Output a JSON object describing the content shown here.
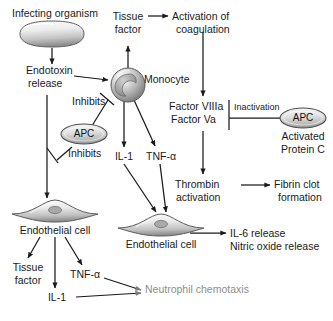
{
  "diagram": {
    "colors": {
      "line": "#1a1a1a",
      "cell_fill_light": "#f2f2f2",
      "cell_fill_mid": "#b8b8b8",
      "cell_fill_dark": "#7d7d7d",
      "nucleus": "#9a9a9a",
      "faded_text": "#8d8d8d",
      "background": "#ffffff"
    },
    "nodes": {
      "infecting_organism": "Infecting organism",
      "endotoxin_release_line1": "Endotoxin",
      "endotoxin_release_line2": "release",
      "inhibits_upper": "Inhibits",
      "inhibits_lower": "Inhibits",
      "apc_left": "APC",
      "apc_right": "APC",
      "activated_protein_c_line1": "Activated",
      "activated_protein_c_line2": "Protein C",
      "monocyte": "Monocyte",
      "tissue_factor_top_line1": "Tissue",
      "tissue_factor_top_line2": "factor",
      "activation_of_coagulation_line1": "Activation of",
      "activation_of_coagulation_line2": "coagulation",
      "factor_viiia": "Factor VIIIa",
      "factor_va": "Factor Va",
      "inactivation": "Inactivation",
      "il1_monocyte": "IL-1",
      "tnfa_monocyte": "TNF-α",
      "thrombin_activation_line1": "Thrombin",
      "thrombin_activation_line2": "activation",
      "fibrin_clot_line1": "Fibrin clot",
      "fibrin_clot_line2": "formation",
      "endothelial_cell_left": "Endothelial cell",
      "endothelial_cell_mid": "Endothelial cell",
      "il6_release": "IL-6 release",
      "nitric_oxide_release": "Nitric oxide release",
      "tissue_factor_bottom_line1": "Tissue",
      "tissue_factor_bottom_line2": "factor",
      "tnfa_endothelial": "TNF-α",
      "il1_endothelial": "IL-1",
      "neutrophil_chemotaxis": "Neutrophil chemotaxis"
    },
    "cells": {
      "bacillus_label": "infecting-organism-bacillus",
      "monocyte_label": "monocyte-cell",
      "endothelial_left_label": "endothelial-cell-left",
      "endothelial_mid_label": "endothelial-cell-middle"
    },
    "edges": [
      {
        "from": "infecting_organism",
        "to": "endotoxin_release",
        "type": "arrow"
      },
      {
        "from": "endotoxin_release",
        "to": "monocyte",
        "type": "arrow"
      },
      {
        "from": "endotoxin_release",
        "to": "endothelial_cell_left",
        "type": "arrow"
      },
      {
        "from": "apc_left",
        "to": "endotoxin_monocyte_link",
        "type": "inhibit"
      },
      {
        "from": "apc_left",
        "to": "endotoxin_endothelial_link",
        "type": "inhibit"
      },
      {
        "from": "monocyte",
        "to": "tissue_factor_top",
        "type": "arrow"
      },
      {
        "from": "tissue_factor_top",
        "to": "activation_of_coagulation",
        "type": "arrow"
      },
      {
        "from": "activation_of_coagulation",
        "to": "factor_viiia_va",
        "type": "arrow"
      },
      {
        "from": "apc_right",
        "to": "factor_viiia_va",
        "type": "inactivation-bar"
      },
      {
        "from": "factor_viiia_va",
        "to": "thrombin_activation",
        "type": "arrow"
      },
      {
        "from": "thrombin_activation",
        "to": "fibrin_clot_formation",
        "type": "arrow"
      },
      {
        "from": "monocyte",
        "to": "il1_monocyte",
        "type": "arrow"
      },
      {
        "from": "monocyte",
        "to": "tnfa_monocyte",
        "type": "arrow"
      },
      {
        "from": "il1_monocyte",
        "to": "endothelial_cell_mid",
        "type": "arrow"
      },
      {
        "from": "tnfa_monocyte",
        "to": "endothelial_cell_mid",
        "type": "arrow"
      },
      {
        "from": "endothelial_cell_mid",
        "to": "il6_and_nitric_oxide",
        "type": "arrow"
      },
      {
        "from": "endothelial_cell_left",
        "to": "tissue_factor_bottom",
        "type": "arrow"
      },
      {
        "from": "endothelial_cell_left",
        "to": "il1_endothelial",
        "type": "arrow"
      },
      {
        "from": "endothelial_cell_left",
        "to": "tnfa_endothelial",
        "type": "arrow"
      },
      {
        "from": "tnfa_endothelial",
        "to": "neutrophil_chemotaxis",
        "type": "arrow"
      },
      {
        "from": "il1_endothelial",
        "to": "neutrophil_chemotaxis",
        "type": "arrow"
      }
    ]
  }
}
